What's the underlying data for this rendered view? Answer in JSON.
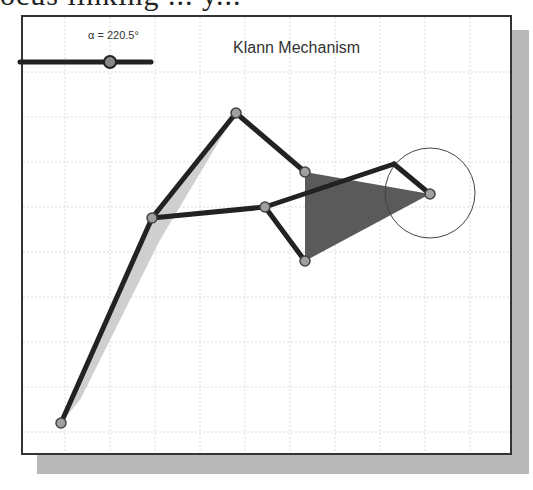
{
  "page": {
    "cropped_text": "ocus linking  ...  y..."
  },
  "figure": {
    "title": "Klann Mechanism",
    "slider": {
      "label": "α = 220.5°",
      "value": 220.5,
      "unit": "°"
    },
    "colors": {
      "link": "#222222",
      "joint": "#999999",
      "triangle": "#555555",
      "trace": "#cccccc",
      "grid": "#d8d8d8",
      "circle": "#444444"
    },
    "joints": [
      {
        "name": "foot",
        "x": 61,
        "y": 423
      },
      {
        "name": "knee",
        "x": 152,
        "y": 218
      },
      {
        "name": "hip-top",
        "x": 236,
        "y": 113
      },
      {
        "name": "tri-top",
        "x": 305,
        "y": 172
      },
      {
        "name": "mid",
        "x": 265,
        "y": 207
      },
      {
        "name": "tri-bottom",
        "x": 305,
        "y": 261
      },
      {
        "name": "crank",
        "x": 430,
        "y": 194
      },
      {
        "name": "rocker",
        "x": 394,
        "y": 164
      }
    ],
    "crank_circle": {
      "cx": 430,
      "cy": 193,
      "r": 45
    }
  }
}
